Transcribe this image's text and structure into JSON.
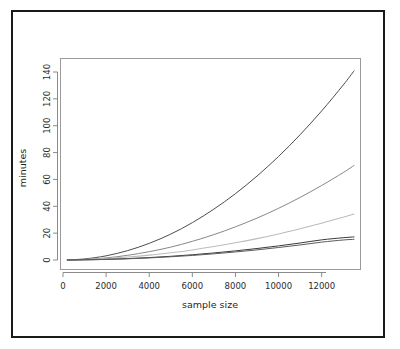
{
  "figure": {
    "background": "#ffffff",
    "border_color": "#1a1a1a",
    "plot_box_color": "#9a9a9a",
    "axis_color": "#8a8a8a"
  },
  "chart_data": {
    "type": "line",
    "title": "",
    "xlabel": "sample size",
    "ylabel": "minutes",
    "xlim": [
      0,
      13700
    ],
    "ylim": [
      0,
      147
    ],
    "grid": false,
    "legend": null,
    "xticks": [
      0,
      2000,
      4000,
      6000,
      8000,
      10000,
      12000
    ],
    "xticklabels": [
      "0",
      "2000",
      "4000",
      "6000",
      "8000",
      "10000",
      "12000"
    ],
    "yticks": [
      0,
      20,
      40,
      60,
      80,
      100,
      120,
      140
    ],
    "yticklabels": [
      "0",
      "20",
      "40",
      "60",
      "80",
      "100",
      "120",
      "140"
    ],
    "x": [
      200,
      1000,
      2000,
      3000,
      4000,
      5000,
      6000,
      7000,
      8000,
      9000,
      10000,
      11000,
      12000,
      13000,
      13500
    ],
    "series": [
      {
        "name": "curve-1",
        "color": "#4d4d4d",
        "width": 1.0,
        "dash": "none",
        "values": [
          0.1,
          0.8,
          3.1,
          7.0,
          12.4,
          19.3,
          27.8,
          37.9,
          49.4,
          62.5,
          77.1,
          93.3,
          111.0,
          130.3,
          140.8
        ]
      },
      {
        "name": "curve-2",
        "color": "#878787",
        "width": 1.0,
        "dash": "none",
        "values": [
          0.05,
          0.4,
          1.55,
          3.5,
          6.2,
          9.6,
          13.9,
          18.9,
          24.7,
          31.2,
          38.5,
          46.6,
          55.5,
          65.1,
          70.4
        ]
      },
      {
        "name": "curve-3",
        "color": "#bcbcbc",
        "width": 1.1,
        "dash": "none",
        "values": [
          0.05,
          0.35,
          1.1,
          2.2,
          3.6,
          5.4,
          7.5,
          10.0,
          12.8,
          15.9,
          19.4,
          23.3,
          27.4,
          31.9,
          34.2
        ]
      },
      {
        "name": "curve-4",
        "color": "#3a3a3a",
        "width": 1.0,
        "dash": "none",
        "values": [
          0.02,
          0.15,
          0.5,
          1.05,
          1.8,
          2.75,
          3.9,
          5.25,
          6.8,
          8.55,
          10.5,
          12.65,
          15.0,
          16.6,
          17.2
        ]
      },
      {
        "name": "curve-5",
        "color": "#5c5c5c",
        "width": 1.0,
        "dash": "none",
        "values": [
          0.02,
          0.12,
          0.42,
          0.9,
          1.55,
          2.4,
          3.4,
          4.6,
          6.0,
          7.55,
          9.3,
          11.2,
          13.3,
          14.9,
          15.4
        ]
      }
    ]
  }
}
